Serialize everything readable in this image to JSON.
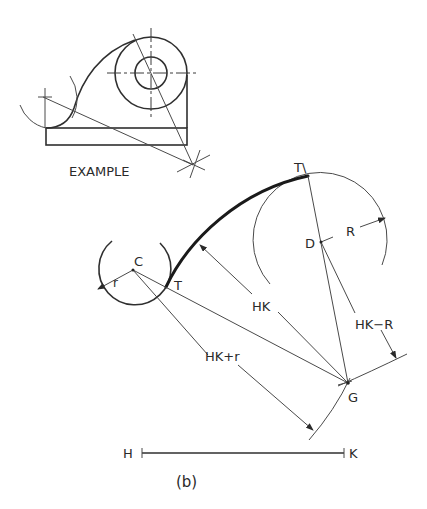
{
  "example": {
    "caption": "EXAMPLE"
  },
  "figure_b": {
    "caption": "(b)",
    "points": {
      "C": "C",
      "T": "T",
      "T1": "T\\",
      "D": "D",
      "G": "G",
      "H": "H",
      "K": "K"
    },
    "dimensions": {
      "small_radius": "r",
      "large_radius": "R",
      "hk": "HK",
      "hk_plus_r": "HK+r",
      "hk_minus_R": "HK−R"
    }
  },
  "colors": {
    "line": "#2f2f2f",
    "background": "#ffffff"
  }
}
